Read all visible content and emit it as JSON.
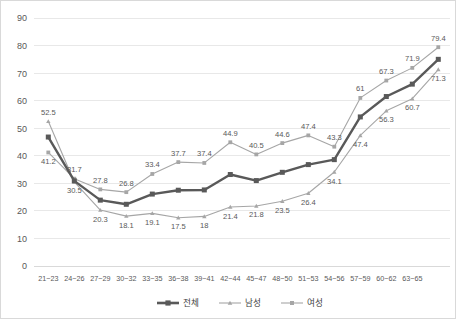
{
  "chart_data": {
    "type": "line",
    "title": "",
    "subtitle": "",
    "xlabel": "",
    "ylabel": "",
    "ylim": [
      0,
      90
    ],
    "ytick_step": 10,
    "yticks": [
      "0",
      "10",
      "20",
      "30",
      "40",
      "50",
      "60",
      "70",
      "80",
      "90"
    ],
    "grid": true,
    "legend_position": "bottom",
    "categories": [
      "21~23",
      "24~26",
      "27~29",
      "30~32",
      "33~35",
      "36~38",
      "39~41",
      "42~44",
      "45~47",
      "48~50",
      "51~53",
      "54~56",
      "57~59",
      "60~62",
      "63~65"
    ],
    "series": [
      {
        "name": "전체",
        "marker": "square",
        "color": "#595959",
        "line_width": 2.4,
        "labels_shown": false,
        "values": [
          46.8,
          30.9,
          23.9,
          22.4,
          26.1,
          27.5,
          27.6,
          33.2,
          31.0,
          34.0,
          36.8,
          38.6,
          54.1,
          61.5,
          66.0
        ]
      },
      {
        "name": "남성",
        "marker": "triangle",
        "color": "#a6a6a6",
        "line_width": 1.1,
        "labels_shown": true,
        "values": [
          52.5,
          30.5,
          20.3,
          18.1,
          19.1,
          17.5,
          18.0,
          21.4,
          21.8,
          23.5,
          26.4,
          34.1,
          47.4,
          56.3,
          60.7
        ],
        "labels": [
          "52.5",
          "30.5",
          "20.3",
          "18.1",
          "19.1",
          "17.5",
          "18",
          "21.4",
          "21.8",
          "23.5",
          "26.4",
          "34.1",
          "47.4",
          "56.3",
          "60.7"
        ]
      },
      {
        "name": "여성",
        "marker": "square",
        "color": "#a6a6a6",
        "line_width": 1.1,
        "labels_shown": true,
        "values": [
          41.2,
          31.7,
          27.8,
          26.8,
          33.4,
          37.7,
          37.4,
          44.9,
          40.5,
          44.6,
          47.4,
          43.3,
          61.0,
          67.3,
          71.9
        ],
        "labels": [
          "41.2",
          "31.7",
          "27.8",
          "26.8",
          "33.4",
          "37.7",
          "37.4",
          "44.9",
          "40.5",
          "44.6",
          "47.4",
          "43.3",
          "61",
          "67.3",
          "71.9"
        ]
      }
    ],
    "endpoint_labels": [
      {
        "series": "여성",
        "value": 79.4,
        "label": "79.4"
      },
      {
        "series": "남성",
        "value": 71.3,
        "label": "71.3"
      },
      {
        "series": "전체",
        "value": 75.0,
        "label": ""
      }
    ],
    "extra_point_note": "final rightmost cluster extends past last category tick",
    "legend": [
      {
        "label": "전체",
        "marker": "square",
        "color": "#595959"
      },
      {
        "label": "남성",
        "marker": "triangle",
        "color": "#a6a6a6"
      },
      {
        "label": "여성",
        "marker": "square",
        "color": "#a6a6a6"
      }
    ]
  }
}
